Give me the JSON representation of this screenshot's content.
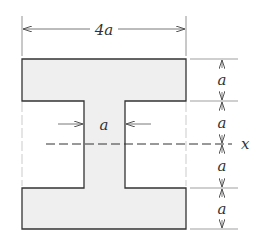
{
  "diagram": {
    "type": "I-beam cross-section",
    "colors": {
      "fill": "#efefef",
      "stroke": "#333333",
      "dim": "#555555"
    },
    "labels": {
      "width": "4a",
      "web_width": "a",
      "top_flange": "a",
      "upper_web": "a",
      "lower_web": "a",
      "bottom_flange": "a",
      "axis": "x"
    }
  }
}
